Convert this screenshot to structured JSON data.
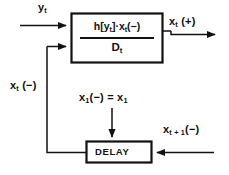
{
  "diagram": {
    "type": "block-diagram",
    "background_color": "#ffffff",
    "line_color": "#111111",
    "text_color": "#111111"
  },
  "blocks": [
    {
      "name": "main-block",
      "label_numerator": "h [ y_t ] · x_t (−)",
      "label_denominator": "D_t",
      "numerator_parts": {
        "h": "h",
        "bracket_open": "[",
        "y": "y",
        "y_sub": "t",
        "bracket_close": "]",
        "dot": "·",
        "x": "x",
        "x_sub": "t",
        "sign": "(−)"
      },
      "denominator_parts": {
        "d": "D",
        "d_sub": "t"
      },
      "x": 71,
      "y": 13,
      "width": 92,
      "height": 50
    },
    {
      "name": "delay-block",
      "label": "DELAY",
      "x": 86,
      "y": 141,
      "width": 66,
      "height": 22
    }
  ],
  "labels": {
    "y_input": {
      "base": "y",
      "sub": "t",
      "suffix": ""
    },
    "x_output": {
      "base": "x",
      "sub": "t",
      "suffix": " (+)"
    },
    "x_feedback": {
      "base": "x",
      "sub": "t",
      "suffix": " (−)"
    },
    "x_initial": {
      "base": "x",
      "sub": "1",
      "mid": "(−)  =  x",
      "sub2": "1"
    },
    "x_t_plus_1": {
      "base": "x",
      "sub": "t + 1",
      "suffix": "(−)"
    },
    "delay_text": "DELAY"
  },
  "label_text": {
    "y_input": "y t",
    "x_output": "x t (+)",
    "x_feedback": "x t (−)",
    "x_initial": "x 1 (−) = x 1",
    "x_t_plus_1": "x t + 1 (−)",
    "delay": "DELAY"
  },
  "connections": [
    {
      "name": "input-y-arrow",
      "from": "left-edge",
      "to": "main-block-top-left",
      "direction": "right"
    },
    {
      "name": "feedback-into-main-arrow",
      "from": "feedback-riser",
      "to": "main-block-bottom-left",
      "direction": "right"
    },
    {
      "name": "main-output-arrow",
      "from": "main-block-right",
      "to": "right-edge",
      "direction": "right"
    },
    {
      "name": "feedback-loop-line",
      "from": "delay-block-left",
      "to": "main-block-bottom-left",
      "direction": "up-left"
    },
    {
      "name": "initial-condition-arrow",
      "from": "x-initial-label",
      "to": "delay-block-top",
      "direction": "down"
    },
    {
      "name": "delay-input-arrow",
      "from": "right-edge",
      "to": "delay-block-right",
      "direction": "left"
    }
  ]
}
